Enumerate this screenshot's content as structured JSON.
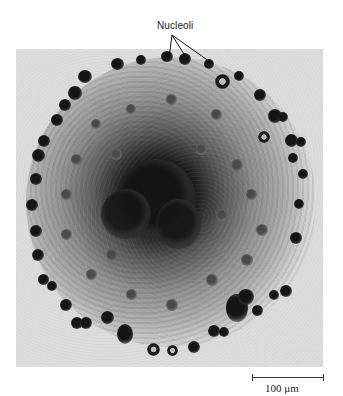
{
  "figure": {
    "annotation_label": "Nucleoli",
    "annotation_pointer_count": 3,
    "scale_bar": {
      "value": "100",
      "unit": "μm",
      "label": "100 μm"
    },
    "image_description": "Grayscale light micrograph of a spherical cell (oocyte nucleus) with dark nucleoli scattered throughout and concentrated around the periphery and center"
  },
  "colors": {
    "background": "#ffffff",
    "photo_background": "#dcdcdc",
    "stain_dark": "#151515",
    "text": "#222222"
  }
}
